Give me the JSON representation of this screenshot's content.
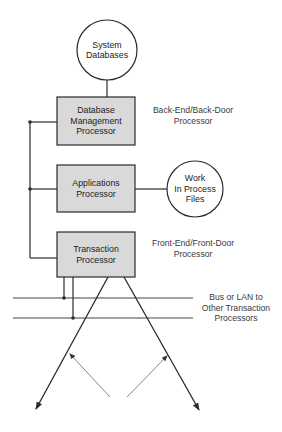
{
  "diagram": {
    "nodes": {
      "system_databases": {
        "label": "System\nDatabases",
        "shape": "circle"
      },
      "db_mgmt_processor": {
        "label": "Database\nManagement\nProcessor",
        "shape": "box"
      },
      "applications_processor": {
        "label": "Applications\nProcessor",
        "shape": "box"
      },
      "transaction_processor": {
        "label": "Transaction\nProcessor",
        "shape": "box"
      },
      "work_in_process_files": {
        "label": "Work\nIn Process\nFiles",
        "shape": "circle"
      }
    },
    "annotations": {
      "back_end": "Back-End/Back-Door\nProcessor",
      "front_end": "Front-End/Front-Door\nProcessor",
      "bus": "Bus or LAN to\nOther Transaction\nProcessors"
    },
    "colors": {
      "box_fill": "#d9d9d9",
      "line": "#2a2a2a",
      "thin_arrow": "#888888"
    }
  }
}
